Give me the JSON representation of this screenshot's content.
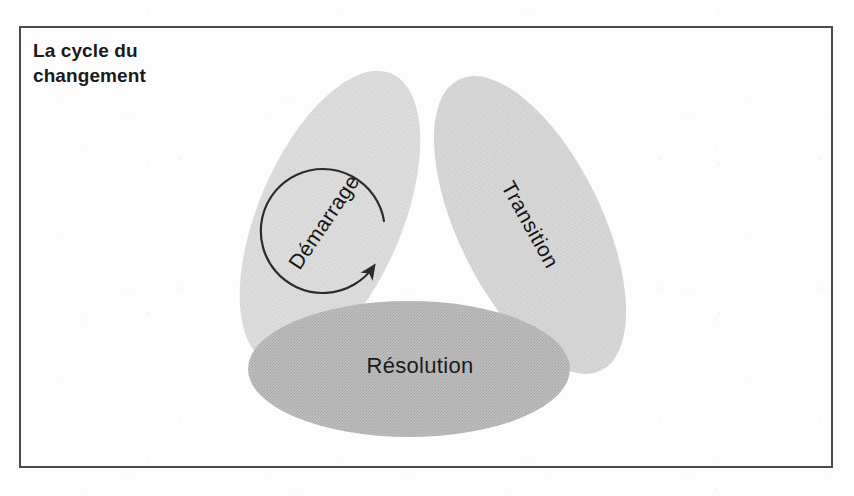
{
  "figure": {
    "title": "La cycle du\nchangement",
    "title_line1": "La cycle du",
    "title_line2": "changement",
    "frame": {
      "border_color": "#4a4a4a",
      "background_color": "#ffffff"
    }
  },
  "diagram": {
    "type": "cycle",
    "flow_direction": "counter-clockwise",
    "center_arrow": {
      "name": "cycle-arrow",
      "shape": "circular-arrow",
      "color": "#2b2b2b",
      "gap_position": "upper-left",
      "arrowhead_position": "lower-left"
    },
    "segments": [
      {
        "id": "demarrage",
        "label": "Démarrage",
        "shape": "ellipse-petal",
        "position": "upper-left",
        "rotation_deg": -55,
        "fill": "#d9d9d9"
      },
      {
        "id": "transition",
        "label": "Transition",
        "shape": "ellipse-petal",
        "position": "upper-right",
        "rotation_deg": 60,
        "fill": "#d2d2d2"
      },
      {
        "id": "resolution",
        "label": "Résolution",
        "shape": "ellipse-base",
        "position": "bottom",
        "rotation_deg": 0,
        "fill": "#b5b5b5"
      }
    ]
  }
}
